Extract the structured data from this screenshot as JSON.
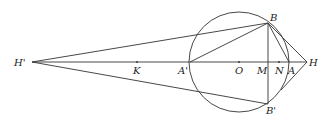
{
  "diagram": {
    "type": "geometry",
    "circle": {
      "center": "O",
      "cx": 239,
      "cy": 62,
      "r": 50
    },
    "points": [
      {
        "id": "Hp",
        "label": "H'",
        "x": 32,
        "y": 62,
        "lx": 14,
        "ly": 66
      },
      {
        "id": "K",
        "label": "K",
        "x": 137,
        "y": 62,
        "lx": 133,
        "ly": 74
      },
      {
        "id": "Ap",
        "label": "A'",
        "x": 190,
        "y": 62,
        "lx": 178,
        "ly": 74
      },
      {
        "id": "O",
        "label": "O",
        "x": 239,
        "y": 62,
        "lx": 235,
        "ly": 74
      },
      {
        "id": "M",
        "label": "M",
        "x": 268,
        "y": 62,
        "lx": 257,
        "ly": 74
      },
      {
        "id": "N",
        "label": "N",
        "x": 279,
        "y": 62,
        "lx": 275,
        "ly": 74
      },
      {
        "id": "A",
        "label": "A",
        "x": 289,
        "y": 62,
        "lx": 288,
        "ly": 74
      },
      {
        "id": "H",
        "label": "H",
        "x": 307,
        "y": 62,
        "lx": 309,
        "ly": 66
      },
      {
        "id": "B",
        "label": "B",
        "x": 268,
        "y": 23,
        "lx": 270,
        "ly": 21
      },
      {
        "id": "Bp",
        "label": "B'",
        "x": 268,
        "y": 104,
        "lx": 266,
        "ly": 114
      },
      {
        "id": "T",
        "label": "",
        "x": 281,
        "y": 90,
        "lx": 0,
        "ly": 0
      }
    ],
    "segments": [
      [
        "Hp",
        "H"
      ],
      [
        "Hp",
        "B"
      ],
      [
        "Hp",
        "Bp"
      ],
      [
        "Ap",
        "B"
      ],
      [
        "B",
        "Bp"
      ],
      [
        "B",
        "A"
      ],
      [
        "B",
        "H"
      ],
      [
        "H",
        "T"
      ]
    ]
  }
}
